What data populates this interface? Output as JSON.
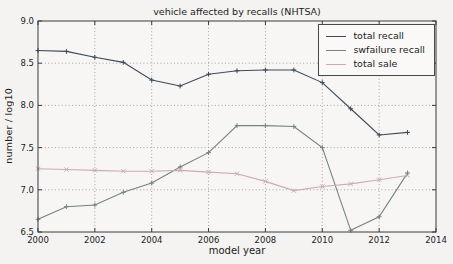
{
  "chart_data": {
    "type": "line",
    "title": "vehicle affected by recalls (NHTSA)",
    "xlabel": "model year",
    "ylabel": "number / log10",
    "xlim": [
      2000,
      2014
    ],
    "ylim": [
      6.5,
      9.0
    ],
    "xticks": [
      2000,
      2002,
      2004,
      2006,
      2008,
      2010,
      2012,
      2014
    ],
    "yticks": [
      6.5,
      7.0,
      7.5,
      8.0,
      8.5,
      9.0
    ],
    "grid": true,
    "legend_position": "upper right",
    "x": [
      2000,
      2001,
      2002,
      2003,
      2004,
      2005,
      2006,
      2007,
      2008,
      2009,
      2010,
      2011,
      2012,
      2013
    ],
    "series": [
      {
        "name": "total recall",
        "color": "#3f4856",
        "marker": "plus",
        "values": [
          8.65,
          8.64,
          8.57,
          8.51,
          8.3,
          8.23,
          8.37,
          8.41,
          8.42,
          8.42,
          8.27,
          7.96,
          7.65,
          7.68
        ]
      },
      {
        "name": "swfailure recall",
        "color": "#76837a",
        "marker": "plus",
        "values": [
          6.65,
          6.8,
          6.82,
          6.97,
          7.08,
          7.27,
          7.44,
          7.76,
          7.76,
          7.75,
          7.5,
          6.52,
          6.68,
          7.2
        ]
      },
      {
        "name": "total sale",
        "color": "#c9adaf",
        "marker": "x",
        "values": [
          7.25,
          7.24,
          7.23,
          7.22,
          7.22,
          7.23,
          7.21,
          7.19,
          7.1,
          6.99,
          7.04,
          7.07,
          7.12,
          7.17
        ]
      }
    ]
  }
}
